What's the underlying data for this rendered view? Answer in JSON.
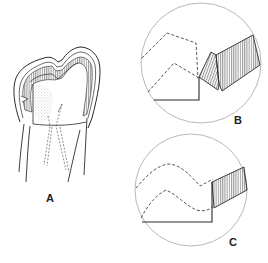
{
  "figure": {
    "panels": [
      {
        "id": "A",
        "label": "A",
        "description": "Tooth crown with cavity preparation, hatched enamel walls and dashed pulp outline"
      },
      {
        "id": "B",
        "label": "B",
        "description": "Magnified circular detail: cavosurface margin with beveled enamel (hatched) and dashed pulp horns"
      },
      {
        "id": "C",
        "label": "C",
        "description": "Magnified circular detail: butt-joint margin with hatched enamel and dashed pulp outline"
      }
    ],
    "colors": {
      "line": "#2a2a2a",
      "circle": "#9a9a9a",
      "background": "#ffffff"
    }
  }
}
